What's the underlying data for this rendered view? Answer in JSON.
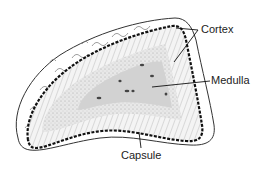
{
  "diagram": {
    "labels": {
      "cortex": "Cortex",
      "medulla": "Medulla",
      "capsule": "Capsule"
    },
    "colors": {
      "outline": "#333333",
      "capsule_border": "#111111",
      "cortex_fill": "#f2f2f2",
      "zone_fill": "#e6e6e6",
      "medulla_fill": "#d2d2d2",
      "nuclei": "#444444",
      "background": "#ffffff"
    }
  }
}
